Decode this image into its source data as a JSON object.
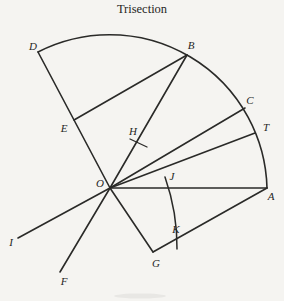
{
  "title": "Trisection",
  "colors": {
    "ink": "#2a2a28",
    "paper": "#f5f4f1"
  },
  "diagram": {
    "center_point": "O",
    "labels": [
      {
        "id": "D",
        "text": "D",
        "x": 33,
        "y": 50
      },
      {
        "id": "B",
        "text": "B",
        "x": 191,
        "y": 49
      },
      {
        "id": "C",
        "text": "C",
        "x": 250,
        "y": 104
      },
      {
        "id": "T",
        "text": "T",
        "x": 266,
        "y": 131
      },
      {
        "id": "E",
        "text": "E",
        "x": 64,
        "y": 132
      },
      {
        "id": "H",
        "text": "H",
        "x": 133,
        "y": 135
      },
      {
        "id": "O",
        "text": "O",
        "x": 100,
        "y": 187
      },
      {
        "id": "J",
        "text": "J",
        "x": 172,
        "y": 180
      },
      {
        "id": "A",
        "text": "A",
        "x": 271,
        "y": 200
      },
      {
        "id": "I",
        "text": "I",
        "x": 11,
        "y": 246
      },
      {
        "id": "K",
        "text": "K",
        "x": 176,
        "y": 233
      },
      {
        "id": "F",
        "text": "F",
        "x": 64,
        "y": 285
      },
      {
        "id": "G",
        "text": "G",
        "x": 156,
        "y": 267
      }
    ],
    "segments": [
      {
        "name": "ray-O-D",
        "x1": 110,
        "y1": 188,
        "x2": 38,
        "y2": 52,
        "w": 1.6
      },
      {
        "name": "ray-O-B",
        "x1": 110,
        "y1": 188,
        "x2": 187,
        "y2": 55,
        "w": 1.6
      },
      {
        "name": "ray-O-C",
        "x1": 110,
        "y1": 188,
        "x2": 245,
        "y2": 108,
        "w": 1.6
      },
      {
        "name": "ray-O-T",
        "x1": 110,
        "y1": 188,
        "x2": 255,
        "y2": 133,
        "w": 1.6
      },
      {
        "name": "ray-O-A",
        "x1": 110,
        "y1": 188,
        "x2": 267,
        "y2": 188,
        "w": 1.6
      },
      {
        "name": "ray-O-G",
        "x1": 110,
        "y1": 188,
        "x2": 153,
        "y2": 252,
        "w": 1.6
      },
      {
        "name": "ray-O-F",
        "x1": 110,
        "y1": 188,
        "x2": 60,
        "y2": 272,
        "w": 1.6
      },
      {
        "name": "ray-O-I",
        "x1": 110,
        "y1": 188,
        "x2": 18,
        "y2": 238,
        "w": 1.6
      },
      {
        "name": "chord-E-B",
        "x1": 74,
        "y1": 120,
        "x2": 187,
        "y2": 55,
        "w": 1.6
      },
      {
        "name": "line-G-A",
        "x1": 153,
        "y1": 252,
        "x2": 267,
        "y2": 188,
        "w": 1.6
      },
      {
        "name": "tick-H",
        "x1": 130,
        "y1": 139,
        "x2": 147,
        "y2": 147,
        "w": 1.3
      }
    ],
    "arcs": [
      {
        "name": "main-arc-A-D",
        "path": "M 267 188 A 157.4 157.4 0 0 0 38 52",
        "w": 1.6
      },
      {
        "name": "small-arc-J-K",
        "path": "M 165 177 Q 177.5 213 177 249",
        "w": 1.5
      }
    ]
  }
}
